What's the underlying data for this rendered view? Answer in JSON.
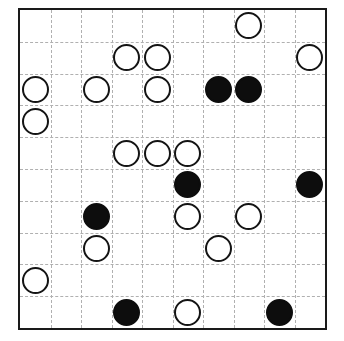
{
  "board": {
    "title": "Stone Grid Puzzle Board",
    "rows": 10,
    "columns": 10,
    "geometry": {
      "left": 18,
      "top": 8,
      "width": 309,
      "height": 322,
      "cell_width": 30.9,
      "cell_height": 32.2,
      "stone_diameter": 27
    },
    "colors": {
      "background": "#ffffff",
      "border": "#1a1a1a",
      "grid_line": "#b0b0b0",
      "black_stone": "#0d0d0d",
      "white_stone_fill": "#ffffff",
      "white_stone_outline": "#141414"
    },
    "border_width": 2,
    "grid_line_style": "dashed",
    "counts": {
      "black_stones": 8,
      "white_stones": 17,
      "total_stones": 25,
      "empty_cells": 75
    },
    "stones": [
      {
        "row": 0,
        "col": 7,
        "color": "white"
      },
      {
        "row": 1,
        "col": 3,
        "color": "white"
      },
      {
        "row": 1,
        "col": 4,
        "color": "white"
      },
      {
        "row": 1,
        "col": 9,
        "color": "white"
      },
      {
        "row": 2,
        "col": 0,
        "color": "white"
      },
      {
        "row": 2,
        "col": 2,
        "color": "white"
      },
      {
        "row": 2,
        "col": 4,
        "color": "white"
      },
      {
        "row": 2,
        "col": 6,
        "color": "black"
      },
      {
        "row": 2,
        "col": 7,
        "color": "black"
      },
      {
        "row": 3,
        "col": 0,
        "color": "white"
      },
      {
        "row": 4,
        "col": 3,
        "color": "white"
      },
      {
        "row": 4,
        "col": 4,
        "color": "white"
      },
      {
        "row": 4,
        "col": 5,
        "color": "white"
      },
      {
        "row": 5,
        "col": 5,
        "color": "black"
      },
      {
        "row": 5,
        "col": 9,
        "color": "black"
      },
      {
        "row": 6,
        "col": 2,
        "color": "black"
      },
      {
        "row": 6,
        "col": 5,
        "color": "white"
      },
      {
        "row": 6,
        "col": 7,
        "color": "white"
      },
      {
        "row": 7,
        "col": 2,
        "color": "white"
      },
      {
        "row": 7,
        "col": 6,
        "color": "white"
      },
      {
        "row": 8,
        "col": 0,
        "color": "white"
      },
      {
        "row": 9,
        "col": 3,
        "color": "black"
      },
      {
        "row": 9,
        "col": 5,
        "color": "white"
      },
      {
        "row": 9,
        "col": 8,
        "color": "black"
      }
    ]
  }
}
